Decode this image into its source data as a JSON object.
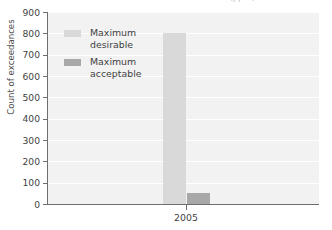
{
  "chart_data": {
    "type": "bar",
    "title": "SNP Year 2005 Nitrate Exceedances (ppm)",
    "xlabel": "",
    "ylabel": "Count of exceedances",
    "categories": [
      "2005"
    ],
    "series": [
      {
        "name": "Maximum desirable",
        "values": [
          800
        ],
        "color": "#d9d9d9"
      },
      {
        "name": "Maximum acceptable",
        "values": [
          50
        ],
        "color": "#a8a8a8"
      }
    ],
    "ylim": [
      0,
      900
    ],
    "yticks": [
      900,
      800,
      700,
      600,
      500,
      400,
      300,
      200,
      100,
      0
    ],
    "grid": true,
    "legend_position": "upper-left-inside"
  },
  "axes": {
    "y_title": "Count of exceedances",
    "y_tick_labels": [
      "900",
      "800",
      "700",
      "600",
      "500",
      "400",
      "300",
      "200",
      "100",
      "0"
    ],
    "x_tick_labels": [
      "2005"
    ]
  },
  "legend": {
    "items": [
      {
        "label_line1": "Maximum",
        "label_line2": "desirable",
        "color": "#d9d9d9"
      },
      {
        "label_line1": "Maximum",
        "label_line2": "acceptable",
        "color": "#a8a8a8"
      }
    ]
  },
  "colors": {
    "plot_background": "#f2f2f2",
    "gridline": "#ffffff",
    "axis": "#6e6e6e",
    "text": "#3f3f3f",
    "title": "#b9bcc4"
  }
}
